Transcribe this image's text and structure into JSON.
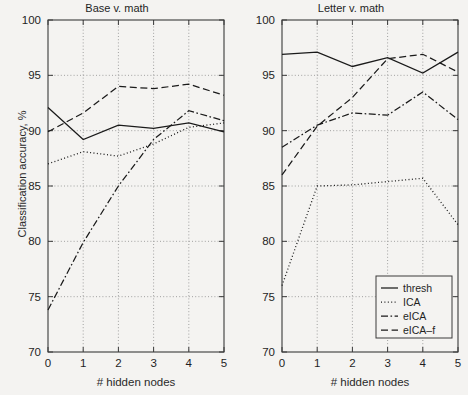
{
  "figure": {
    "ylabel": "Classification accuracy, %",
    "xlabel": "# hidden nodes"
  },
  "legend": {
    "items": [
      {
        "label": "thresh",
        "style": "solid"
      },
      {
        "label": "ICA",
        "style": "dotted"
      },
      {
        "label": "eICA",
        "style": "dashdot"
      },
      {
        "label": "eICA–f",
        "style": "dashed"
      }
    ]
  },
  "yticks": [
    "70",
    "75",
    "80",
    "85",
    "90",
    "95",
    "100"
  ],
  "xticks": [
    "0",
    "1",
    "2",
    "3",
    "4",
    "5"
  ],
  "chart_data": [
    {
      "type": "line",
      "title": "Base v. math",
      "xlabel": "# hidden nodes",
      "ylabel": "Classification accuracy, %",
      "x": [
        0,
        1,
        2,
        3,
        4,
        5
      ],
      "xlim": [
        0,
        5
      ],
      "ylim": [
        70,
        100
      ],
      "grid": true,
      "legend_position": "none",
      "series": [
        {
          "name": "thresh",
          "style": "solid",
          "values": [
            92.1,
            89.2,
            90.5,
            90.2,
            90.7,
            89.9
          ]
        },
        {
          "name": "ICA",
          "style": "dotted",
          "values": [
            87.0,
            88.1,
            87.7,
            88.8,
            90.3,
            90.7
          ]
        },
        {
          "name": "eICA",
          "style": "dashdot",
          "values": [
            73.8,
            79.9,
            85.0,
            89.2,
            91.8,
            90.9
          ]
        },
        {
          "name": "eICA–f",
          "style": "dashed",
          "values": [
            89.9,
            91.6,
            94.0,
            93.8,
            94.2,
            93.2
          ]
        }
      ]
    },
    {
      "type": "line",
      "title": "Letter v. math",
      "xlabel": "# hidden nodes",
      "ylabel": "Classification accuracy, %",
      "x": [
        0,
        1,
        2,
        3,
        4,
        5
      ],
      "xlim": [
        0,
        5
      ],
      "ylim": [
        70,
        100
      ],
      "grid": true,
      "legend_position": "lower-right",
      "series": [
        {
          "name": "thresh",
          "style": "solid",
          "values": [
            96.9,
            97.1,
            95.8,
            96.6,
            95.2,
            97.1
          ]
        },
        {
          "name": "ICA",
          "style": "dotted",
          "values": [
            76.0,
            85.0,
            85.1,
            85.4,
            85.7,
            81.5
          ]
        },
        {
          "name": "eICA",
          "style": "dashdot",
          "values": [
            88.5,
            90.5,
            91.6,
            91.4,
            93.5,
            91.0
          ]
        },
        {
          "name": "eICA–f",
          "style": "dashed",
          "values": [
            86.0,
            90.4,
            93.0,
            96.5,
            96.9,
            95.3
          ]
        }
      ]
    }
  ]
}
